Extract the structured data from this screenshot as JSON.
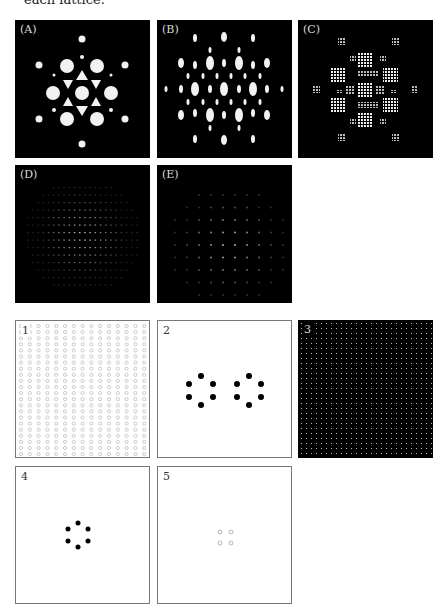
{
  "caption": "each lattice.",
  "diffraction_panels": [
    {
      "id": "A",
      "label": "(A)"
    },
    {
      "id": "B",
      "label": "(B)"
    },
    {
      "id": "C",
      "label": "(C)"
    },
    {
      "id": "D",
      "label": "(D)"
    },
    {
      "id": "E",
      "label": "(E)"
    }
  ],
  "real_space_panels": [
    {
      "id": "1",
      "label": "1",
      "description": "dense square array of small open circles"
    },
    {
      "id": "2",
      "label": "2",
      "description": "two hexagonal rings of six black dots"
    },
    {
      "id": "3",
      "label": "3",
      "description": "dark background with fine square grid of faint dots"
    },
    {
      "id": "4",
      "label": "4",
      "description": "single hexagonal ring of six black dots"
    },
    {
      "id": "5",
      "label": "5",
      "description": "four small open circles in a square"
    }
  ]
}
